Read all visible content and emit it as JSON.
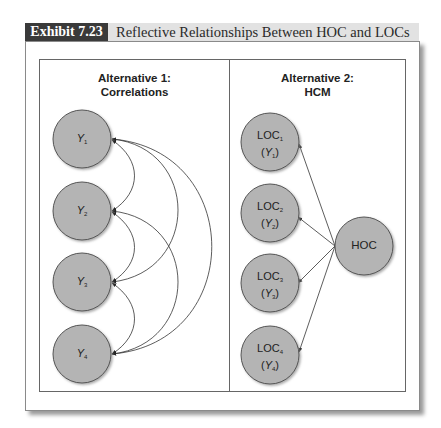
{
  "header": {
    "exhibit_label": "Exhibit 7.23",
    "title": "Reflective Relationships Between HOC and LOCs",
    "label_bg": "#3a3a3a",
    "title_bg": "#e2e2e2"
  },
  "panels": [
    {
      "title_line1": "Alternative 1:",
      "title_line2": "Correlations",
      "nodes": [
        {
          "id": "Y1",
          "symbol": "Y",
          "sub": "1"
        },
        {
          "id": "Y2",
          "symbol": "Y",
          "sub": "2"
        },
        {
          "id": "Y3",
          "symbol": "Y",
          "sub": "3"
        },
        {
          "id": "Y4",
          "symbol": "Y",
          "sub": "4"
        }
      ],
      "edges": [
        {
          "from": "Y1",
          "to": "Y2",
          "type": "double-headed"
        },
        {
          "from": "Y1",
          "to": "Y3",
          "type": "double-headed"
        },
        {
          "from": "Y1",
          "to": "Y4",
          "type": "double-headed"
        },
        {
          "from": "Y2",
          "to": "Y3",
          "type": "double-headed"
        },
        {
          "from": "Y2",
          "to": "Y4",
          "type": "double-headed"
        },
        {
          "from": "Y3",
          "to": "Y4",
          "type": "double-headed"
        }
      ]
    },
    {
      "title_line1": "Alternative 2:",
      "title_line2": "HCM",
      "nodes": [
        {
          "id": "LOC1",
          "name": "LOC",
          "sub": "1",
          "symbol": "Y"
        },
        {
          "id": "LOC2",
          "name": "LOC",
          "sub": "2",
          "symbol": "Y"
        },
        {
          "id": "LOC3",
          "name": "LOC",
          "sub": "3",
          "symbol": "Y"
        },
        {
          "id": "LOC4",
          "name": "LOC",
          "sub": "4",
          "symbol": "Y"
        },
        {
          "id": "HOC",
          "name": "HOC"
        }
      ],
      "edges": [
        {
          "from": "HOC",
          "to": "LOC1",
          "type": "directed"
        },
        {
          "from": "HOC",
          "to": "LOC2",
          "type": "directed"
        },
        {
          "from": "HOC",
          "to": "LOC3",
          "type": "directed"
        },
        {
          "from": "HOC",
          "to": "LOC4",
          "type": "directed"
        }
      ]
    }
  ],
  "colors": {
    "node_fill": "#b4b4b4",
    "node_stroke": "#555555",
    "edge": "#333333"
  }
}
